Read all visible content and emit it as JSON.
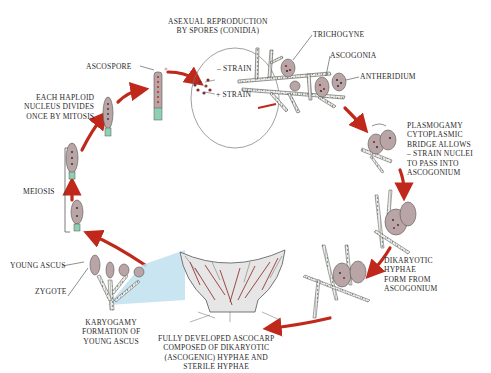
{
  "figure": {
    "colors": {
      "arrow": "#c0281c",
      "cell_fill": "#b9a4a6",
      "hypha_fill": "#e8e8e4",
      "hypha_stroke": "#555555",
      "nucleus_red": "#8b2a2a",
      "nucleus_dark": "#3a3030",
      "zygote_green": "#8fd0b4",
      "wedge_blue": "#bfe0ef",
      "ascocarp_red": "#8a1f1f",
      "label_text": "#2a2a2a"
    }
  },
  "labels": {
    "asexual": [
      "ASEXUAL REPRODUCTION",
      "BY SPORES (CONIDIA)"
    ],
    "trichogyne": "TRICHOGYNE",
    "ascogonia": "ASCOGONIA",
    "antheridium": "ANTHERIDIUM",
    "minus_strain": "– STRAIN",
    "plus_strain": "+ STRAIN",
    "plasmogamy": [
      "PLASMOGAMY",
      "CYTOPLASMIC",
      "BRIDGE ALLOWS",
      "– STRAIN NUCLEI",
      "TO PASS INTO",
      "ASCOGONIUM"
    ],
    "dikaryotic": [
      "DIKARYOTIC",
      "HYPHAE",
      "FORM FROM",
      "ASCOGONIUM"
    ],
    "ascocarp": [
      "FULLY DEVELOPED ASCOCARP",
      "COMPOSED OF DIKARYOTIC",
      "(ASCOGENIC) HYPHAE AND",
      "STERILE HYPHAE"
    ],
    "karyogamy": [
      "KARYOGAMY",
      "FORMATION OF",
      "YOUNG ASCUS"
    ],
    "young_ascus": "YOUNG ASCUS",
    "zygote": "ZYGOTE",
    "meiosis": "MEIOSIS",
    "mitosis": [
      "EACH HAPLOID",
      "NUCLEUS DIVIDES",
      "ONCE BY MITOSIS"
    ],
    "ascospore": "ASCOSPORE"
  }
}
